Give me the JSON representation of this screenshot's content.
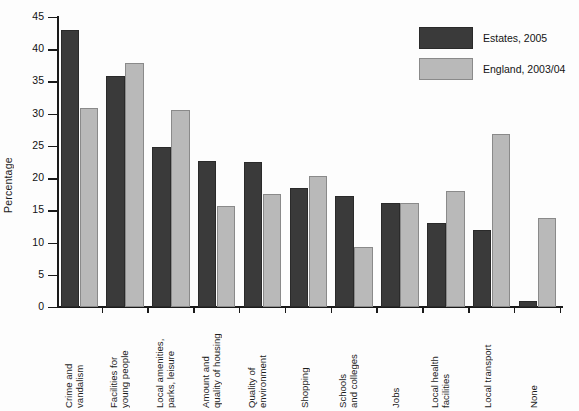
{
  "chart_data": {
    "type": "bar",
    "title": "",
    "xlabel": "",
    "ylabel": "Percentage",
    "ylim": [
      0,
      45
    ],
    "ytick_step": 5,
    "yticks": [
      0,
      5,
      10,
      15,
      20,
      25,
      30,
      35,
      40,
      45
    ],
    "grid": false,
    "legend_position": "top-right",
    "categories": [
      "Crime and vandalism",
      "Facilities for young people",
      "Local amenities, parks, leisure",
      "Amount and quality of housing",
      "Quality of environment",
      "Shopping",
      "Schools and colleges",
      "Jobs",
      "Local health facilities",
      "Local transport",
      "None"
    ],
    "category_lines": [
      [
        "Crime and",
        "vandalism"
      ],
      [
        "Facilities for",
        "young people"
      ],
      [
        "Local amenities,",
        "parks, leisure"
      ],
      [
        "Amount and",
        "quality of housing"
      ],
      [
        "Quality of",
        "environment"
      ],
      [
        "Shopping"
      ],
      [
        "Schools",
        "and colleges"
      ],
      [
        "Jobs"
      ],
      [
        "Local health",
        "facilities"
      ],
      [
        "Local transport"
      ],
      [
        "None"
      ]
    ],
    "series": [
      {
        "name": "Estates, 2005",
        "color": "#3a3a3a",
        "values": [
          43.0,
          35.9,
          24.8,
          22.6,
          22.5,
          18.5,
          17.3,
          16.2,
          13.0,
          11.9,
          1.0
        ]
      },
      {
        "name": "England, 2003/04",
        "color": "#b9b9b9",
        "values": [
          30.9,
          37.8,
          30.6,
          15.6,
          17.5,
          20.4,
          9.3,
          16.1,
          18.0,
          26.8,
          13.8
        ]
      }
    ]
  },
  "legend": {
    "items": [
      {
        "label": "Estates, 2005",
        "swatch": "dark"
      },
      {
        "label": "England, 2003/04",
        "swatch": "light"
      }
    ]
  }
}
